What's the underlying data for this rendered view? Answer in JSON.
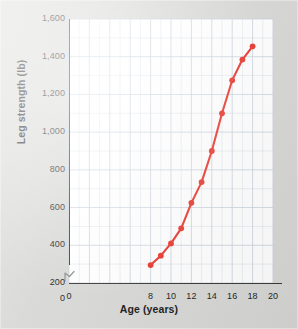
{
  "figure": {
    "background_color": "#d8d8d6",
    "plot_background_color": "#ffffff",
    "accent_color": "#e8342a",
    "grid_color": "#c9d3dd",
    "axis_color": "#3a3a3a"
  },
  "axes": {
    "y_title": "Leg strength (lb)",
    "x_title": "Age (years)",
    "y_ticks": [
      "1,600",
      "1,400",
      "1,200",
      "1,000",
      "800",
      "600",
      "400",
      "200",
      "0"
    ],
    "x_ticks": [
      "0",
      "8",
      "10",
      "12",
      "14",
      "16",
      "18",
      "20"
    ],
    "y_break_marker": "axis-break"
  },
  "chart_data": {
    "type": "line",
    "title": "",
    "xlabel": "Age (years)",
    "ylabel": "Leg strength (lb)",
    "xlim": [
      0,
      20
    ],
    "ylim": [
      0,
      1600
    ],
    "grid": true,
    "legend": false,
    "y_axis_broken_between": [
      0,
      200
    ],
    "x_tick_values": [
      0,
      8,
      10,
      12,
      14,
      16,
      18,
      20
    ],
    "y_tick_values": [
      0,
      200,
      400,
      600,
      800,
      1000,
      1200,
      1400,
      1600
    ],
    "x_gridline_step": 1,
    "y_gridline_step": 100,
    "marker": "filled-circle",
    "marker_color": "#e8342a",
    "line_color": "#e8342a",
    "x": [
      8,
      9,
      10,
      11,
      12,
      13,
      14,
      15,
      16,
      17,
      18
    ],
    "y": [
      295,
      345,
      410,
      490,
      625,
      735,
      900,
      1100,
      1275,
      1385,
      1455
    ],
    "series": [
      {
        "name": "Leg strength",
        "points": [
          {
            "age": 8,
            "strength": 295
          },
          {
            "age": 9,
            "strength": 345
          },
          {
            "age": 10,
            "strength": 410
          },
          {
            "age": 11,
            "strength": 490
          },
          {
            "age": 12,
            "strength": 625
          },
          {
            "age": 13,
            "strength": 735
          },
          {
            "age": 14,
            "strength": 900
          },
          {
            "age": 15,
            "strength": 1100
          },
          {
            "age": 16,
            "strength": 1275
          },
          {
            "age": 17,
            "strength": 1385
          },
          {
            "age": 18,
            "strength": 1455
          }
        ]
      }
    ]
  }
}
